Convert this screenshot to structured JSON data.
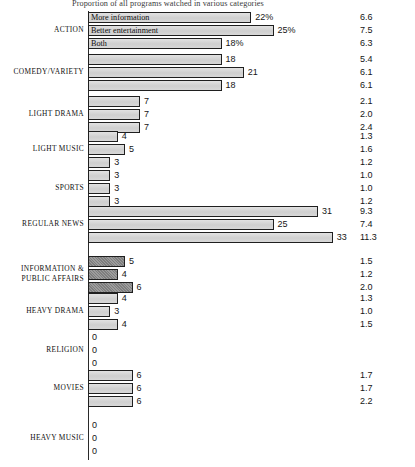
{
  "chart_data": {
    "type": "bar",
    "title": "Proportion of all programs watched in various categories",
    "orientation": "horizontal",
    "xlabel": "",
    "ylabel": "",
    "grid": false,
    "legend_position": "in-bar (first group only)",
    "axis_baseline_value": 0,
    "xlim": [
      0,
      35
    ],
    "series": [
      {
        "name": "More information",
        "shade": "light"
      },
      {
        "name": "Better entertainment",
        "shade": "light"
      },
      {
        "name": "Both",
        "shade": "light"
      }
    ],
    "right_column_header": "",
    "categories": [
      "ACTION",
      "COMEDY/VARIETY",
      "LIGHT DRAMA",
      "LIGHT MUSIC",
      "SPORTS",
      "REGULAR NEWS",
      "INFORMATION & PUBLIC AFFAIRS",
      "HEAVY DRAMA",
      "RELIGION",
      "MOVIES",
      "HEAVY MUSIC"
    ],
    "groups": [
      {
        "category": "ACTION",
        "shade": "light",
        "bars": [
          {
            "series": "More information",
            "value": 22,
            "label": "22%",
            "inbar_text": "More information"
          },
          {
            "series": "Better entertainment",
            "value": 25,
            "label": "25%",
            "inbar_text": "Better entertainment"
          },
          {
            "series": "Both",
            "value": 18,
            "label": "18%",
            "inbar_text": "Both"
          }
        ],
        "right_values": [
          "6.6",
          "7.5",
          "6.3"
        ]
      },
      {
        "category": "COMEDY/VARIETY",
        "shade": "light",
        "bars": [
          {
            "series": "More information",
            "value": 18,
            "label": "18",
            "inbar_text": ""
          },
          {
            "series": "Better entertainment",
            "value": 21,
            "label": "21",
            "inbar_text": ""
          },
          {
            "series": "Both",
            "value": 18,
            "label": "18",
            "inbar_text": ""
          }
        ],
        "right_values": [
          "5.4",
          "6.1",
          "6.1"
        ]
      },
      {
        "category": "LIGHT DRAMA",
        "shade": "light",
        "bars": [
          {
            "series": "More information",
            "value": 7,
            "label": "7",
            "inbar_text": ""
          },
          {
            "series": "Better entertainment",
            "value": 7,
            "label": "7",
            "inbar_text": ""
          },
          {
            "series": "Both",
            "value": 7,
            "label": "7",
            "inbar_text": ""
          }
        ],
        "right_values": [
          "2.1",
          "2.0",
          "2.4"
        ]
      },
      {
        "category": "LIGHT MUSIC",
        "shade": "light",
        "bars": [
          {
            "series": "More information",
            "value": 4,
            "label": "4",
            "inbar_text": ""
          },
          {
            "series": "Better entertainment",
            "value": 5,
            "label": "5",
            "inbar_text": ""
          },
          {
            "series": "Both",
            "value": 3,
            "label": "3",
            "inbar_text": ""
          }
        ],
        "right_values": [
          "1.3",
          "1.6",
          "1.2"
        ]
      },
      {
        "category": "SPORTS",
        "shade": "light",
        "bars": [
          {
            "series": "More information",
            "value": 3,
            "label": "3",
            "inbar_text": ""
          },
          {
            "series": "Better entertainment",
            "value": 3,
            "label": "3",
            "inbar_text": ""
          },
          {
            "series": "Both",
            "value": 3,
            "label": "3",
            "inbar_text": ""
          }
        ],
        "right_values": [
          "1.0",
          "1.0",
          "1.2"
        ]
      },
      {
        "category": "REGULAR NEWS",
        "shade": "light",
        "bars": [
          {
            "series": "More information",
            "value": 31,
            "label": "31",
            "inbar_text": ""
          },
          {
            "series": "Better entertainment",
            "value": 25,
            "label": "25",
            "inbar_text": ""
          },
          {
            "series": "Both",
            "value": 33,
            "label": "33",
            "inbar_text": ""
          }
        ],
        "right_values": [
          "9.3",
          "7.4",
          "11.3"
        ]
      },
      {
        "category": "INFORMATION & PUBLIC AFFAIRS",
        "shade": "dark",
        "bars": [
          {
            "series": "More information",
            "value": 5,
            "label": "5",
            "inbar_text": ""
          },
          {
            "series": "Better entertainment",
            "value": 4,
            "label": "4",
            "inbar_text": ""
          },
          {
            "series": "Both",
            "value": 6,
            "label": "6",
            "inbar_text": ""
          }
        ],
        "right_values": [
          "1.5",
          "1.2",
          "2.0"
        ]
      },
      {
        "category": "HEAVY DRAMA",
        "shade": "light",
        "bars": [
          {
            "series": "More information",
            "value": 4,
            "label": "4",
            "inbar_text": ""
          },
          {
            "series": "Better entertainment",
            "value": 3,
            "label": "3",
            "inbar_text": ""
          },
          {
            "series": "Both",
            "value": 4,
            "label": "4",
            "inbar_text": ""
          }
        ],
        "right_values": [
          "1.3",
          "1.0",
          "1.5"
        ]
      },
      {
        "category": "RELIGION",
        "shade": "light",
        "bars": [
          {
            "series": "More information",
            "value": 0,
            "label": "0",
            "inbar_text": ""
          },
          {
            "series": "Better entertainment",
            "value": 0,
            "label": "0",
            "inbar_text": ""
          },
          {
            "series": "Both",
            "value": 0,
            "label": "0",
            "inbar_text": ""
          }
        ],
        "right_values": [
          "",
          "",
          ""
        ]
      },
      {
        "category": "MOVIES",
        "shade": "light",
        "bars": [
          {
            "series": "More information",
            "value": 6,
            "label": "6",
            "inbar_text": ""
          },
          {
            "series": "Better entertainment",
            "value": 6,
            "label": "6",
            "inbar_text": ""
          },
          {
            "series": "Both",
            "value": 6,
            "label": "6",
            "inbar_text": ""
          }
        ],
        "right_values": [
          "1.7",
          "1.7",
          "2.2"
        ]
      },
      {
        "category": "HEAVY MUSIC",
        "shade": "light",
        "bars": [
          {
            "series": "More information",
            "value": 0,
            "label": "0",
            "inbar_text": ""
          },
          {
            "series": "Better entertainment",
            "value": 0,
            "label": "0",
            "inbar_text": ""
          },
          {
            "series": "Both",
            "value": 0,
            "label": "0",
            "inbar_text": ""
          }
        ],
        "right_values": [
          "",
          "",
          ""
        ]
      }
    ]
  }
}
